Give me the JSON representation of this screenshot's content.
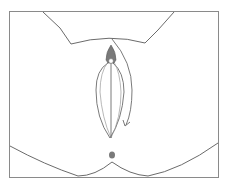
{
  "diagram": {
    "type": "anatomical-line-illustration",
    "frame": {
      "x": 9,
      "y": 11,
      "width": 210,
      "height": 167,
      "stroke": "#8a8a8a"
    },
    "colors": {
      "line": "#6b6b6b",
      "fill_marker": "#7a7a7a",
      "background": "#ffffff"
    },
    "elements": [
      {
        "name": "upper-contour-curve"
      },
      {
        "name": "lower-contour-curve"
      },
      {
        "name": "outer-oval-outline"
      },
      {
        "name": "inner-oval-outline"
      },
      {
        "name": "central-vertical-line"
      },
      {
        "name": "top-marker-filled"
      },
      {
        "name": "curved-direction-arrow"
      },
      {
        "name": "bottom-dot-marker"
      }
    ]
  }
}
